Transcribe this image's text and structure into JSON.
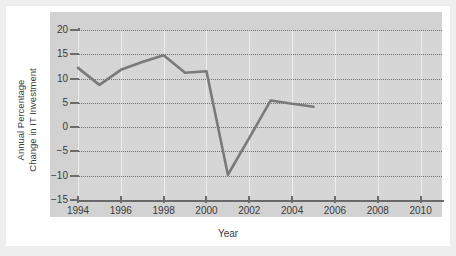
{
  "chart_data": {
    "type": "line",
    "title": "",
    "xlabel": "Year",
    "ylabel": "Annual Percentage\nChange in IT Investment",
    "ylabel_lines": [
      "Annual Percentage",
      "Change in IT Investment"
    ],
    "x": [
      1994,
      1995,
      1996,
      1997,
      1998,
      1999,
      2000,
      2001,
      2002,
      2003,
      2004,
      2005
    ],
    "values": [
      12.2,
      8.7,
      11.8,
      13.4,
      14.8,
      11.2,
      11.5,
      -9.8,
      -2.2,
      5.5,
      4.8,
      4.2
    ],
    "series": [
      {
        "name": "Annual Percentage Change in IT Investment",
        "values": [
          12.2,
          8.7,
          11.8,
          13.4,
          14.8,
          11.2,
          11.5,
          -9.8,
          -2.2,
          5.5,
          4.8,
          4.2
        ]
      }
    ],
    "xlim": [
      1994,
      2011
    ],
    "ylim": [
      -15,
      20
    ],
    "xticks": [
      1994,
      1996,
      1998,
      2000,
      2002,
      2004,
      2006,
      2008,
      2010
    ],
    "xtick_labels": [
      "1994",
      "1996",
      "1998",
      "2000",
      "2002",
      "2004",
      "2006",
      "2008",
      "2010"
    ],
    "yticks": [
      20,
      15,
      10,
      5,
      0,
      -5,
      -10,
      -15
    ],
    "ytick_labels": [
      "20",
      "15",
      "10",
      "5",
      "0",
      "−5",
      "−10",
      "−15"
    ],
    "grid": "horizontal-dotted",
    "legend": "none",
    "line_color": "#7a7a7a",
    "panel_color": "#d4d4d4",
    "axis_color": "#6d6d6d",
    "text_color": "#3b3b3b"
  }
}
